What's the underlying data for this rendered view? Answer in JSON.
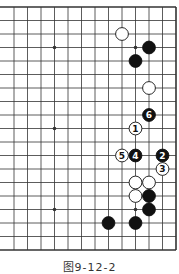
{
  "diagram": {
    "type": "go-board-partial",
    "caption": "图9-12-2",
    "grid": {
      "right_edge_x": 176,
      "top_edge_y": 7,
      "spacing": 13.5,
      "rows": 19,
      "cols_visible": 13,
      "left_open": true
    },
    "star_points": [
      {
        "col": 9,
        "row": 3
      },
      {
        "col": 3,
        "row": 3
      },
      {
        "col": 9,
        "row": 9
      },
      {
        "col": 3,
        "row": 9
      },
      {
        "col": 9,
        "row": 15
      },
      {
        "col": 3,
        "row": 15
      }
    ],
    "stones": [
      {
        "color": "white",
        "col": 4,
        "row": 2,
        "label": ""
      },
      {
        "color": "black",
        "col": 2,
        "row": 3,
        "label": ""
      },
      {
        "color": "black",
        "col": 3,
        "row": 4,
        "label": ""
      },
      {
        "color": "white",
        "col": 2,
        "row": 6,
        "label": ""
      },
      {
        "color": "black",
        "col": 2,
        "row": 8,
        "label": "6"
      },
      {
        "color": "white",
        "col": 3,
        "row": 9,
        "label": "1"
      },
      {
        "color": "white",
        "col": 4,
        "row": 11,
        "label": "5"
      },
      {
        "color": "black",
        "col": 3,
        "row": 11,
        "label": "4"
      },
      {
        "color": "black",
        "col": 1,
        "row": 11,
        "label": "2"
      },
      {
        "color": "white",
        "col": 1,
        "row": 12,
        "label": "3"
      },
      {
        "color": "white",
        "col": 3,
        "row": 13,
        "label": ""
      },
      {
        "color": "white",
        "col": 2,
        "row": 13,
        "label": ""
      },
      {
        "color": "white",
        "col": 3,
        "row": 14,
        "label": ""
      },
      {
        "color": "black",
        "col": 2,
        "row": 14,
        "label": ""
      },
      {
        "color": "black",
        "col": 2,
        "row": 15,
        "label": ""
      },
      {
        "color": "black",
        "col": 5,
        "row": 16,
        "label": ""
      },
      {
        "color": "black",
        "col": 3,
        "row": 16,
        "label": ""
      }
    ],
    "colors": {
      "line": "#333333",
      "black": "#111111",
      "white": "#ffffff"
    }
  }
}
